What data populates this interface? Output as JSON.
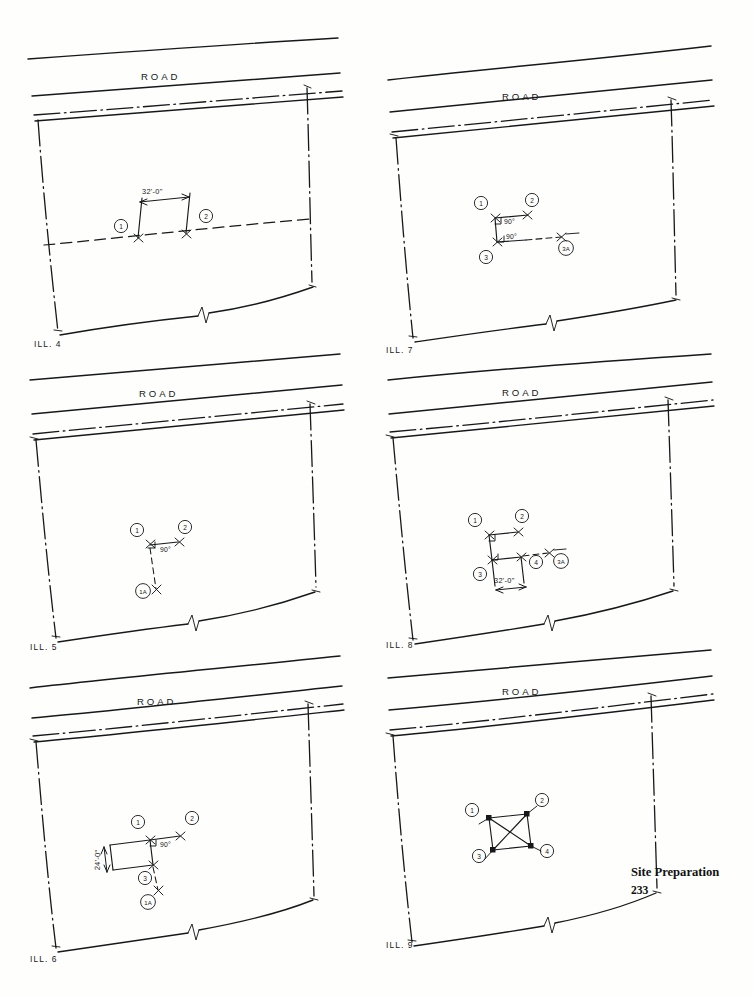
{
  "page": {
    "footer_title": "Site Preparation",
    "footer_page": "233",
    "road_label": "ROAD"
  },
  "labels": {
    "deg90": "90°",
    "dim_32": "32'-0\"",
    "dim_24": "24'-0\""
  },
  "figures": [
    {
      "id": "ill4",
      "caption": "ILL. 4",
      "road_label": "ROAD",
      "description": "Lot with road at top, dash-dot property lines, dashed building setback line, and a 32'-0\" dimension between batter board points 1 and 2.",
      "dimensions": [
        "32'-0\""
      ],
      "angles": [],
      "points": [
        "1",
        "2"
      ]
    },
    {
      "id": "ill5",
      "caption": "ILL. 5",
      "road_label": "ROAD",
      "description": "Lot with three stakes: point 1 at the corner, point 2 to the right, and point 1A below on a dashed line, with a 90° angle marked at point 1.",
      "dimensions": [],
      "angles": [
        "90°"
      ],
      "points": [
        "1",
        "2",
        "1A"
      ]
    },
    {
      "id": "ill6",
      "caption": "ILL. 6",
      "road_label": "ROAD",
      "description": "Lot showing a rectangle with 24'-0\" vertical dimension, a 90° angle at point 1, and stakes 1, 2, 3 and 1A.",
      "dimensions": [
        "24'-0\""
      ],
      "angles": [
        "90°"
      ],
      "points": [
        "1",
        "2",
        "3",
        "1A"
      ]
    },
    {
      "id": "ill7",
      "caption": "ILL. 7",
      "road_label": "ROAD",
      "description": "Lot with stakes 1, 2, 3 and 3A; two 90° angles are marked at the corners of the layout lines.",
      "dimensions": [],
      "angles": [
        "90°",
        "90°"
      ],
      "points": [
        "1",
        "2",
        "3",
        "3A"
      ]
    },
    {
      "id": "ill8",
      "caption": "ILL. 8",
      "road_label": "ROAD",
      "description": "Lot with stakes 1, 2, 3, 4 and 3A, a dashed extension line to 3A, and a 32'-0\" dimension along the lower side.",
      "dimensions": [
        "32'-0\""
      ],
      "angles": [],
      "points": [
        "1",
        "2",
        "3",
        "4",
        "3A"
      ]
    },
    {
      "id": "ill9",
      "caption": "ILL. 9",
      "road_label": "ROAD",
      "description": "Lot with a completed square building layout with both diagonals drawn for squaring, stakes 1, 2, 3 and 4.",
      "dimensions": [],
      "angles": [],
      "points": [
        "1",
        "2",
        "3",
        "4"
      ]
    }
  ]
}
